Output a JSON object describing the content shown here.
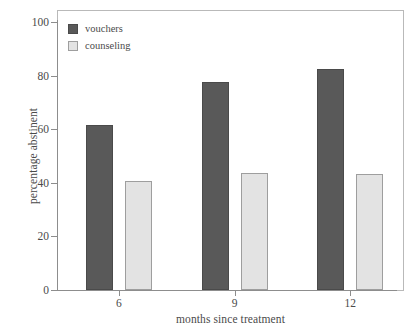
{
  "chart_data": {
    "type": "bar",
    "title": "",
    "xlabel": "months since treatment",
    "ylabel": "percentage abstinent",
    "categories": [
      "6",
      "9",
      "12"
    ],
    "series": [
      {
        "name": "vouchers",
        "values": [
          61.5,
          77.5,
          82.5
        ],
        "color": "#595959"
      },
      {
        "name": "counseling",
        "values": [
          40.7,
          43.5,
          43.3
        ],
        "color": "#e3e3e3"
      }
    ],
    "ylim": [
      0,
      100
    ],
    "ytick_labels": [
      "0",
      "20",
      "40",
      "60",
      "80",
      "100"
    ],
    "ytick_values": [
      0,
      20,
      40,
      60,
      80,
      100
    ],
    "xtick_labels": [
      "6",
      "9",
      "12"
    ],
    "grid": false,
    "legend_position": "top-left",
    "frame": true
  },
  "legend": {
    "entries": [
      {
        "label": "vouchers",
        "swatch": "vouchers-swatch"
      },
      {
        "label": "counseling",
        "swatch": "counseling-swatch"
      }
    ]
  },
  "axes": {
    "y_title": "percentage abstinent",
    "x_title": "months since treatment"
  }
}
